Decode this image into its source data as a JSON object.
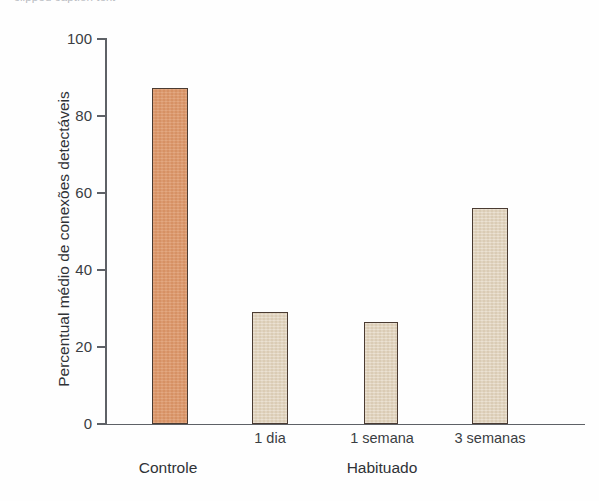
{
  "figure": {
    "top_caption_fragment": "clipped caption text",
    "background_color": "#fefefe"
  },
  "axis": {
    "y_title": "Percentual médio de conexões detectáveis",
    "y_ticks": [
      "0",
      "20",
      "40",
      "60",
      "80",
      "100"
    ],
    "x_tick_labels": [
      "1 dia",
      "1 semana",
      "3 semanas"
    ],
    "group_labels": [
      "Controle",
      "Habituado"
    ],
    "axis_color": "#5e6166"
  },
  "colors": {
    "control_bar_fill": "#dd9769",
    "habituated_bar_fill": "#e1d3bd",
    "bar_border": "#4a3b32",
    "text": "#2f3236"
  },
  "chart_data": {
    "type": "bar",
    "title": "",
    "xlabel": "",
    "ylabel": "Percentual médio de conexões detectáveis",
    "categories": [
      "Controle",
      "1 dia",
      "1 semana",
      "3 semanas"
    ],
    "values": [
      87,
      29,
      26.5,
      56
    ],
    "bar_colors": [
      "#dd9769",
      "#e1d3bd",
      "#e1d3bd",
      "#e1d3bd"
    ],
    "groups": [
      {
        "name": "Controle",
        "categories": [
          "Controle"
        ]
      },
      {
        "name": "Habituado",
        "categories": [
          "1 dia",
          "1 semana",
          "3 semanas"
        ]
      }
    ],
    "ylim": [
      0,
      100
    ],
    "yticks": [
      0,
      20,
      40,
      60,
      80,
      100
    ],
    "grid": false,
    "legend": "none"
  }
}
